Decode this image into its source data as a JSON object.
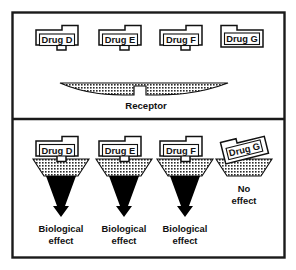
{
  "figure": {
    "colors": {
      "ink": "#111111",
      "frame": "#1a1a1a",
      "background": "#ffffff",
      "receptor_fill": "#808080",
      "arrow_fill": "#000000",
      "label_box_fill": "#ffffff"
    }
  },
  "panels": [
    {
      "id": "top-panel",
      "name": "unbound-panel",
      "drugs": [
        {
          "id": "drug-d",
          "label": "Drug D",
          "key_shape": "notch-top-right-tab-bottom",
          "fits": true
        },
        {
          "id": "drug-e",
          "label": "Drug E",
          "key_shape": "notch-top-right-tab-bottom",
          "fits": true
        },
        {
          "id": "drug-f",
          "label": "Drug F",
          "key_shape": "notch-top-right-tab-bottom",
          "fits": true
        },
        {
          "id": "drug-g",
          "label": "Drug G",
          "key_shape": "notch-top-left-no-tab",
          "fits": false
        }
      ],
      "receptor": {
        "label": "Receptor",
        "shape": "wide-concave-with-central-notch",
        "fill": "hatched"
      }
    },
    {
      "id": "bottom-panel",
      "name": "binding-outcome-panel",
      "outcomes": [
        {
          "id": "outcome-d",
          "drug_label": "Drug D",
          "bound": true,
          "arrow": "down-arrow",
          "effect_lines": [
            "Biological",
            "effect"
          ]
        },
        {
          "id": "outcome-e",
          "drug_label": "Drug E",
          "bound": true,
          "arrow": "down-arrow",
          "effect_lines": [
            "Biological",
            "effect"
          ]
        },
        {
          "id": "outcome-f",
          "drug_label": "Drug F",
          "bound": true,
          "arrow": "down-arrow",
          "effect_lines": [
            "Biological",
            "effect"
          ]
        },
        {
          "id": "outcome-g",
          "drug_label": "Drug G",
          "bound": false,
          "arrow": "none",
          "effect_lines": [
            "No",
            "effect"
          ]
        }
      ]
    }
  ]
}
